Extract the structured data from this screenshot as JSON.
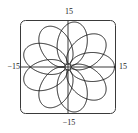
{
  "figure": {
    "title": "",
    "type": "parametric-polar-plot",
    "frame": {
      "shape": "rounded-rectangle",
      "x_min_px": 20,
      "y_min_px": 20,
      "x_max_px": 116,
      "y_max_px": 114,
      "corner_radius_px": 5,
      "stroke_color": "#3a3a3a",
      "stroke_width_px": 1
    },
    "axes": {
      "origin_px": {
        "x": 68,
        "y": 67
      },
      "stroke_color": "#3a3a3a",
      "stroke_width_px": 1,
      "grid": false
    }
  },
  "labels": {
    "top": "15",
    "bottom": "−15",
    "left": "−15",
    "right": "15"
  },
  "colors": {
    "curve": "#1c1c1c",
    "frame": "#3a3a3a",
    "axis": "#3a3a3a",
    "text": "#1a1a1a",
    "background": "#ffffff"
  },
  "chart_data": {
    "type": "line",
    "title": "",
    "subtitle": "",
    "xlabel": "",
    "ylabel": "",
    "xlim": [
      -15,
      15
    ],
    "ylim": [
      -15,
      15
    ],
    "xticks": [
      -15,
      15
    ],
    "yticks": [
      -15,
      15
    ],
    "xticklabels": [
      "−15",
      "15"
    ],
    "yticklabels": [
      "−15",
      "15"
    ],
    "grid": false,
    "legend": null,
    "annotations": [],
    "series": [
      {
        "name": "epitrochoid",
        "description": "Looped rose / epitrochoid style closed curve with 9 inner loops inscribed in a circle of radius ~11 units",
        "equation_polar": "r = 8 + 3*cos(9*theta)",
        "parametric": {
          "x": "(8 + 3*cos(9*t))*cos(t) + 2.6*cos(10*t)",
          "y": "(8 + 3*cos(9*t))*sin(t) + 2.6*sin(10*t)",
          "t_min": 0,
          "t_max": 6.283185307179586,
          "samples": 2000
        },
        "loop_count": 9,
        "outer_radius": 11.2,
        "inner_radius": 4.2,
        "stroke_color": "#1c1c1c",
        "stroke_width_px": 1
      }
    ]
  }
}
